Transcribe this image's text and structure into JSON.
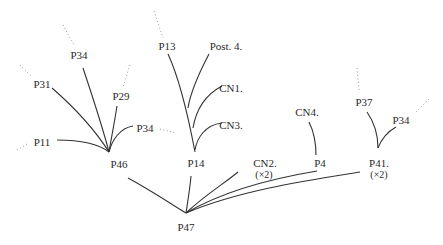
{
  "diagram": {
    "type": "tree",
    "colors": {
      "edge": "#333333",
      "dotted": "#9a9a9a",
      "text": "#2a2a2a",
      "background": "#ffffff"
    },
    "nodes": [
      {
        "id": "p47",
        "label": "P47",
        "x": 186,
        "y": 227
      },
      {
        "id": "p46",
        "label": "P46",
        "x": 119,
        "y": 164
      },
      {
        "id": "p14",
        "label": "P14",
        "x": 196,
        "y": 163
      },
      {
        "id": "cn2",
        "label": "CN2.",
        "sub": "(×2)",
        "x": 265,
        "y": 163
      },
      {
        "id": "p4",
        "label": "P4",
        "x": 320,
        "y": 163
      },
      {
        "id": "p41",
        "label": "P41.",
        "sub": "(×2)",
        "x": 379,
        "y": 163
      },
      {
        "id": "p11",
        "label": "P11",
        "x": 42,
        "y": 142
      },
      {
        "id": "p31",
        "label": "P31",
        "x": 42,
        "y": 84
      },
      {
        "id": "p34a",
        "label": "P34",
        "x": 79,
        "y": 55
      },
      {
        "id": "p29",
        "label": "P29",
        "x": 121,
        "y": 96
      },
      {
        "id": "p34b",
        "label": "P34",
        "x": 145,
        "y": 128
      },
      {
        "id": "p13",
        "label": "P13",
        "x": 167,
        "y": 46
      },
      {
        "id": "post4",
        "label": "Post. 4.",
        "x": 226,
        "y": 46
      },
      {
        "id": "cn1",
        "label": "CN1.",
        "x": 231,
        "y": 88
      },
      {
        "id": "cn3",
        "label": "CN3.",
        "x": 231,
        "y": 125
      },
      {
        "id": "cn4",
        "label": "CN4.",
        "x": 307,
        "y": 112
      },
      {
        "id": "p37",
        "label": "P37",
        "x": 364,
        "y": 102
      },
      {
        "id": "p34c",
        "label": "P34",
        "x": 401,
        "y": 120
      }
    ],
    "edges": [
      [
        "p47",
        "p46"
      ],
      [
        "p47",
        "p14"
      ],
      [
        "p47",
        "cn2"
      ],
      [
        "p47",
        "p4"
      ],
      [
        "p47",
        "p41"
      ],
      [
        "p46",
        "p11"
      ],
      [
        "p46",
        "p31"
      ],
      [
        "p46",
        "p34a"
      ],
      [
        "p46",
        "p29"
      ],
      [
        "p46",
        "p34b"
      ],
      [
        "p14",
        "p13"
      ],
      [
        "p14",
        "post4"
      ],
      [
        "p14",
        "cn1"
      ],
      [
        "p14",
        "cn3"
      ],
      [
        "p4",
        "cn4"
      ],
      [
        "p41",
        "p37"
      ],
      [
        "p41",
        "p34c"
      ]
    ],
    "dotted_continuations": [
      "p34a",
      "p31",
      "p29",
      "p34b",
      "p11",
      "p13",
      "p37",
      "p34c"
    ]
  }
}
